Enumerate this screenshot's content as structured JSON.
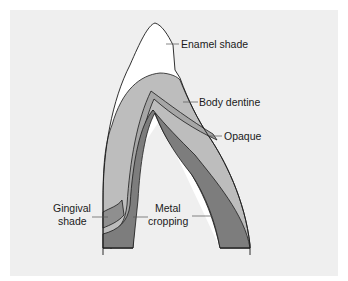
{
  "diagram": {
    "type": "cross-section",
    "labels": {
      "enamel": "Enamel shade",
      "body": "Body dentine",
      "opaque": "Opaque",
      "gingival_line1": "Gingival",
      "gingival_line2": "shade",
      "metal_line1": "Metal",
      "metal_line2": "cropping"
    },
    "colors": {
      "background": "#efefef",
      "enamel": "#ffffff",
      "body_dentine": "#bdbdbd",
      "opaque": "#a6a6a6",
      "gingival": "#8f8f8f",
      "metal": "#7d7d7d",
      "outline": "#1a1a1a"
    }
  }
}
